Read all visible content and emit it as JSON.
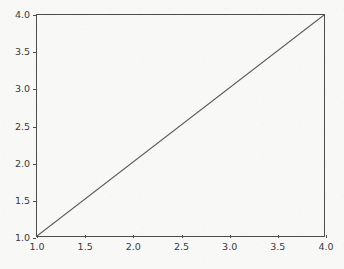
{
  "chart_data": {
    "type": "line",
    "title": "",
    "xlabel": "",
    "ylabel": "",
    "x": [
      1.0,
      4.0
    ],
    "values": [
      1.0,
      4.0
    ],
    "series": [
      {
        "name": "",
        "x": [
          1.0,
          4.0
        ],
        "values": [
          1.0,
          4.0
        ]
      }
    ],
    "xlim": [
      1.0,
      4.0
    ],
    "ylim": [
      1.0,
      4.0
    ],
    "xticks": [
      1.0,
      1.5,
      2.0,
      2.5,
      3.0,
      3.5,
      4.0
    ],
    "yticks": [
      1.0,
      1.5,
      2.0,
      2.5,
      3.0,
      3.5,
      4.0
    ],
    "xticklabels": [
      "1.0",
      "1.5",
      "2.0",
      "2.5",
      "3.0",
      "3.5",
      "4.0"
    ],
    "yticklabels": [
      "1.0",
      "1.5",
      "2.0",
      "2.5",
      "3.0",
      "3.5",
      "4.0"
    ],
    "grid": false,
    "legend": null,
    "annotations": [],
    "colors": {
      "line": "#5a5a5a",
      "axes_spine": "#4d4d4d",
      "tick_label": "#3b3b3b",
      "figure_background": "#f8f8f6",
      "axes_background": "#ffffff"
    },
    "line_width": 1
  }
}
